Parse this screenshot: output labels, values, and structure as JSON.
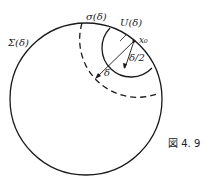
{
  "figure": {
    "caption": "図 4. 9",
    "labels": {
      "sigma_big": "Σ(δ)",
      "sigma_small": "σ(δ)",
      "u": "U(δ)",
      "x0": "x₀",
      "delta": "δ",
      "half_delta": "δ/2"
    },
    "colors": {
      "stroke": "#1a1a1a",
      "background": "#ffffff"
    }
  }
}
